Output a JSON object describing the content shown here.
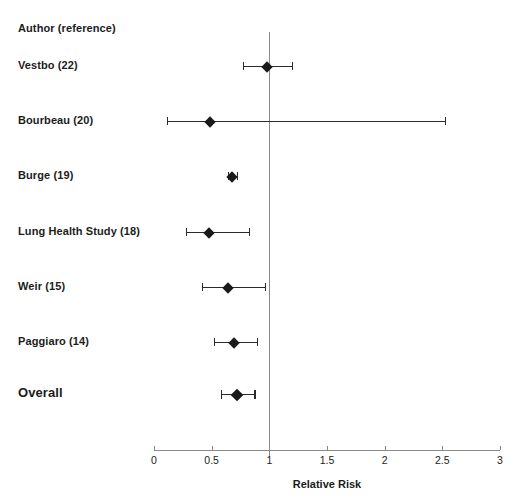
{
  "figure": {
    "column_header": "Author (reference)",
    "axis_title": "Relative Risk"
  },
  "chart_data": {
    "type": "scatter",
    "subtype": "forest-plot",
    "title": "",
    "xlabel": "Relative Risk",
    "ylabel": "Author (reference)",
    "xlim": [
      0,
      3
    ],
    "xticks": [
      0,
      0.5,
      1,
      1.5,
      2,
      2.5,
      3
    ],
    "xticklabels": [
      "0",
      "0.5",
      "1",
      "1.5",
      "2",
      "2.5",
      "3"
    ],
    "grid": false,
    "legend": "none",
    "reference_line": 1,
    "categories": [
      "Vestbo (22)",
      "Bourbeau (20)",
      "Burge (19)",
      "Lung Health Study (18)",
      "Weir (15)",
      "Paggiaro (14)",
      "Overall"
    ],
    "points": [
      {
        "label": "Vestbo (22)",
        "estimate": 0.98,
        "ci_low": 0.77,
        "ci_high": 1.2,
        "summary": false
      },
      {
        "label": "Bourbeau (20)",
        "estimate": 0.49,
        "ci_low": 0.11,
        "ci_high": 2.52,
        "summary": false
      },
      {
        "label": "Burge (19)",
        "estimate": 0.68,
        "ci_low": 0.64,
        "ci_high": 0.72,
        "summary": false
      },
      {
        "label": "Lung Health Study (18)",
        "estimate": 0.48,
        "ci_low": 0.28,
        "ci_high": 0.82,
        "summary": false
      },
      {
        "label": "Weir (15)",
        "estimate": 0.64,
        "ci_low": 0.42,
        "ci_high": 0.96,
        "summary": false
      },
      {
        "label": "Paggiaro (14)",
        "estimate": 0.69,
        "ci_low": 0.52,
        "ci_high": 0.89,
        "summary": false
      },
      {
        "label": "Overall",
        "estimate": 0.72,
        "ci_low": 0.58,
        "ci_high": 0.87,
        "summary": true
      }
    ]
  },
  "colors": {
    "marker": "#1a1a1a",
    "ci": "#2b2b2b",
    "axis": "#8a8a8a",
    "text": "#1c1c1c",
    "background": "#ffffff"
  },
  "geometry": {
    "x_at_zero": 154,
    "px_per_unit": 115.3,
    "label_x": 18,
    "axis_y": 450,
    "ref_line_top": 32,
    "tick_label_y": 454,
    "axis_title_y": 478,
    "row_y": [
      66,
      121,
      176,
      232,
      287,
      342,
      394
    ],
    "header_y": 30
  }
}
